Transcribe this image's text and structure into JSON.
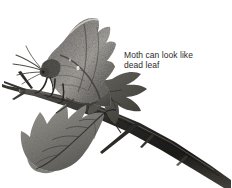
{
  "figure": {
    "background_color": "#ffffff",
    "width": 232,
    "height": 188
  },
  "annotation": {
    "text": "Moth can look like\ndead leaf",
    "line_1": "Moth can look like",
    "line_2": "dead leaf",
    "color": "#2b2b2b"
  },
  "subjects": [
    {
      "name": "moth",
      "description": "Dead-leaf mimicking moth with jagged mottled grey-brown wings, resting head-down on the branch"
    },
    {
      "name": "branch",
      "description": "Dark woody thorned branch running diagonally from upper-left to lower-right"
    },
    {
      "name": "lower-leaf",
      "description": "Lobed serrated hawthorn-type leaf pointing down and to the left"
    },
    {
      "name": "rear-leaf",
      "description": "Second lobed leaf behind the moth pointing down and to the right"
    },
    {
      "name": "thorns",
      "description": "Sharp thorns projecting from the branch"
    }
  ],
  "palette": {
    "ink_darkest": "#1c1c1c",
    "ink_dark": "#3a3a3a",
    "ink_mid": "#6e6e6e",
    "ink_light": "#9c9c9c",
    "ink_pale": "#c4c4c4",
    "paper": "#ffffff"
  }
}
